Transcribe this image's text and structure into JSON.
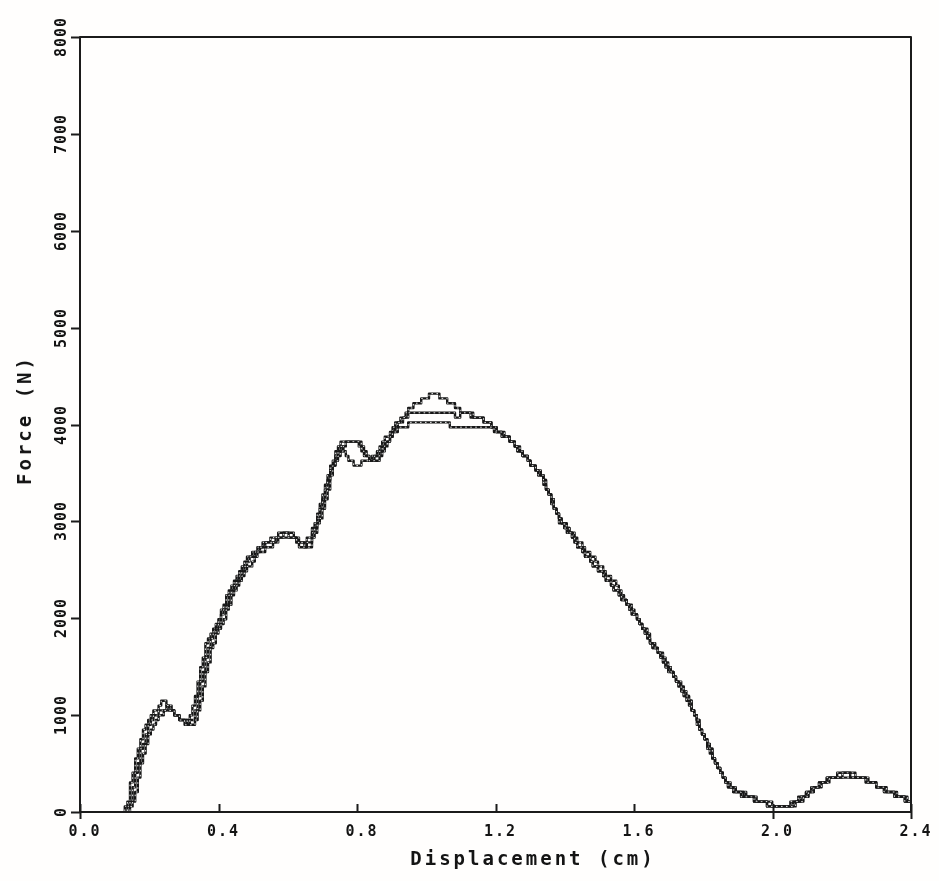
{
  "chart_data": {
    "type": "line",
    "title": "",
    "xlabel": "Displacement (cm)",
    "ylabel": "Force (N)",
    "xlim": [
      0,
      2.4
    ],
    "ylim": [
      0,
      8000
    ],
    "x_tick_labels": [
      "0.0",
      "0.4",
      "0.8",
      "1.2",
      "1.6",
      "2.0",
      "2.4"
    ],
    "x_tick_values": [
      0,
      0.4,
      0.8,
      1.2,
      1.6,
      2.0,
      2.4
    ],
    "y_tick_labels": [
      "0",
      "1000",
      "2000",
      "3000",
      "4000",
      "5000",
      "6000",
      "7000",
      "8000"
    ],
    "y_tick_values": [
      0,
      1000,
      2000,
      3000,
      4000,
      5000,
      6000,
      7000,
      8000
    ],
    "grid": "off",
    "legend": "none",
    "frame": "full-box",
    "line_color": "#171717",
    "plot_style": "digitized-plotter-steps",
    "series": [
      {
        "name": "trace-1",
        "points": [
          [
            0.128,
            0
          ],
          [
            0.14,
            130
          ],
          [
            0.152,
            360
          ],
          [
            0.166,
            600
          ],
          [
            0.182,
            820
          ],
          [
            0.198,
            950
          ],
          [
            0.214,
            1030
          ],
          [
            0.228,
            1090
          ],
          [
            0.238,
            1160
          ],
          [
            0.246,
            1115
          ],
          [
            0.262,
            1065
          ],
          [
            0.278,
            1000
          ],
          [
            0.292,
            950
          ],
          [
            0.306,
            928
          ],
          [
            0.32,
            975
          ],
          [
            0.335,
            1180
          ],
          [
            0.35,
            1480
          ],
          [
            0.365,
            1720
          ],
          [
            0.382,
            1870
          ],
          [
            0.4,
            1995
          ],
          [
            0.42,
            2180
          ],
          [
            0.44,
            2345
          ],
          [
            0.46,
            2475
          ],
          [
            0.48,
            2595
          ],
          [
            0.5,
            2690
          ],
          [
            0.522,
            2755
          ],
          [
            0.546,
            2805
          ],
          [
            0.57,
            2865
          ],
          [
            0.59,
            2905
          ],
          [
            0.61,
            2880
          ],
          [
            0.626,
            2810
          ],
          [
            0.646,
            2790
          ],
          [
            0.662,
            2815
          ],
          [
            0.676,
            2945
          ],
          [
            0.69,
            3105
          ],
          [
            0.705,
            3300
          ],
          [
            0.72,
            3520
          ],
          [
            0.736,
            3675
          ],
          [
            0.752,
            3790
          ],
          [
            0.766,
            3832
          ],
          [
            0.8,
            3835
          ],
          [
            0.814,
            3755
          ],
          [
            0.83,
            3655
          ],
          [
            0.846,
            3615
          ],
          [
            0.862,
            3660
          ],
          [
            0.878,
            3762
          ],
          [
            0.895,
            3872
          ],
          [
            0.912,
            3968
          ],
          [
            0.936,
            4092
          ],
          [
            0.962,
            4195
          ],
          [
            0.986,
            4262
          ],
          [
            1.008,
            4302
          ],
          [
            1.036,
            4296
          ],
          [
            1.058,
            4242
          ],
          [
            1.082,
            4186
          ],
          [
            1.106,
            4132
          ],
          [
            1.13,
            4086
          ],
          [
            1.156,
            4058
          ],
          [
            1.176,
            4018
          ],
          [
            1.196,
            3968
          ],
          [
            1.216,
            3905
          ],
          [
            1.242,
            3838
          ],
          [
            1.272,
            3718
          ],
          [
            1.302,
            3598
          ],
          [
            1.332,
            3475
          ],
          [
            1.356,
            3268
          ],
          [
            1.384,
            3012
          ],
          [
            1.415,
            2862
          ],
          [
            1.442,
            2742
          ],
          [
            1.47,
            2602
          ],
          [
            1.5,
            2478
          ],
          [
            1.53,
            2360
          ],
          [
            1.556,
            2248
          ],
          [
            1.586,
            2108
          ],
          [
            1.612,
            1985
          ],
          [
            1.644,
            1772
          ],
          [
            1.672,
            1628
          ],
          [
            1.702,
            1462
          ],
          [
            1.732,
            1295
          ],
          [
            1.76,
            1138
          ],
          [
            1.788,
            868
          ],
          [
            1.817,
            642
          ],
          [
            1.846,
            418
          ],
          [
            1.874,
            262
          ],
          [
            1.902,
            198
          ],
          [
            1.932,
            152
          ],
          [
            1.962,
            103
          ],
          [
            2.0,
            64
          ],
          [
            2.032,
            54
          ],
          [
            2.062,
            92
          ],
          [
            2.092,
            172
          ],
          [
            2.122,
            252
          ],
          [
            2.152,
            322
          ],
          [
            2.182,
            372
          ],
          [
            2.212,
            386
          ],
          [
            2.242,
            368
          ],
          [
            2.272,
            322
          ],
          [
            2.302,
            262
          ],
          [
            2.332,
            212
          ],
          [
            2.362,
            162
          ],
          [
            2.386,
            124
          ],
          [
            2.4,
            108
          ]
        ]
      },
      {
        "name": "trace-2",
        "points": [
          [
            0.136,
            0
          ],
          [
            0.148,
            120
          ],
          [
            0.16,
            340
          ],
          [
            0.174,
            580
          ],
          [
            0.19,
            800
          ],
          [
            0.206,
            935
          ],
          [
            0.222,
            1010
          ],
          [
            0.238,
            1065
          ],
          [
            0.252,
            1082
          ],
          [
            0.268,
            1040
          ],
          [
            0.284,
            975
          ],
          [
            0.298,
            932
          ],
          [
            0.312,
            912
          ],
          [
            0.326,
            952
          ],
          [
            0.342,
            1160
          ],
          [
            0.356,
            1450
          ],
          [
            0.372,
            1700
          ],
          [
            0.388,
            1855
          ],
          [
            0.406,
            1985
          ],
          [
            0.426,
            2170
          ],
          [
            0.446,
            2340
          ],
          [
            0.466,
            2468
          ],
          [
            0.486,
            2585
          ],
          [
            0.506,
            2682
          ],
          [
            0.528,
            2742
          ],
          [
            0.552,
            2792
          ],
          [
            0.576,
            2845
          ],
          [
            0.596,
            2872
          ],
          [
            0.614,
            2838
          ],
          [
            0.63,
            2772
          ],
          [
            0.65,
            2752
          ],
          [
            0.666,
            2792
          ],
          [
            0.68,
            2932
          ],
          [
            0.694,
            3092
          ],
          [
            0.709,
            3290
          ],
          [
            0.724,
            3512
          ],
          [
            0.74,
            3668
          ],
          [
            0.755,
            3788
          ],
          [
            0.77,
            3655
          ],
          [
            0.79,
            3592
          ],
          [
            0.812,
            3595
          ],
          [
            0.828,
            3622
          ],
          [
            0.845,
            3655
          ],
          [
            0.862,
            3738
          ],
          [
            0.88,
            3845
          ],
          [
            0.898,
            3942
          ],
          [
            0.918,
            4032
          ],
          [
            0.945,
            4098
          ],
          [
            0.975,
            4112
          ],
          [
            1.01,
            4112
          ],
          [
            1.045,
            4105
          ],
          [
            1.075,
            4112
          ],
          [
            1.088,
            4082
          ],
          [
            1.1,
            4108
          ],
          [
            1.13,
            4098
          ],
          [
            1.158,
            4062
          ],
          [
            1.18,
            4012
          ],
          [
            1.2,
            3952
          ],
          [
            1.218,
            3898
          ],
          [
            1.244,
            3832
          ],
          [
            1.274,
            3712
          ],
          [
            1.304,
            3592
          ],
          [
            1.334,
            3468
          ],
          [
            1.358,
            3262
          ],
          [
            1.386,
            3022
          ],
          [
            1.418,
            2878
          ],
          [
            1.444,
            2772
          ],
          [
            1.472,
            2658
          ],
          [
            1.502,
            2545
          ],
          [
            1.532,
            2415
          ],
          [
            1.558,
            2285
          ],
          [
            1.588,
            2122
          ],
          [
            1.614,
            1992
          ],
          [
            1.646,
            1782
          ],
          [
            1.674,
            1638
          ],
          [
            1.704,
            1472
          ],
          [
            1.734,
            1305
          ],
          [
            1.762,
            1148
          ],
          [
            1.79,
            878
          ],
          [
            1.819,
            652
          ],
          [
            1.848,
            428
          ],
          [
            1.876,
            272
          ],
          [
            1.904,
            208
          ],
          [
            1.934,
            162
          ],
          [
            1.964,
            113
          ],
          [
            2.002,
            74
          ],
          [
            2.034,
            62
          ],
          [
            2.064,
            100
          ],
          [
            2.094,
            180
          ],
          [
            2.124,
            260
          ],
          [
            2.154,
            330
          ],
          [
            2.184,
            380
          ],
          [
            2.214,
            394
          ],
          [
            2.244,
            376
          ],
          [
            2.274,
            330
          ],
          [
            2.304,
            270
          ],
          [
            2.334,
            220
          ],
          [
            2.364,
            170
          ],
          [
            2.388,
            132
          ],
          [
            2.4,
            116
          ]
        ]
      },
      {
        "name": "trace-3",
        "points": [
          [
            0.144,
            0
          ],
          [
            0.156,
            110
          ],
          [
            0.168,
            320
          ],
          [
            0.182,
            560
          ],
          [
            0.198,
            780
          ],
          [
            0.214,
            915
          ],
          [
            0.23,
            988
          ],
          [
            0.246,
            1045
          ],
          [
            0.26,
            1052
          ],
          [
            0.276,
            1012
          ],
          [
            0.292,
            952
          ],
          [
            0.306,
            912
          ],
          [
            0.32,
            898
          ],
          [
            0.334,
            935
          ],
          [
            0.35,
            1140
          ],
          [
            0.364,
            1430
          ],
          [
            0.38,
            1680
          ],
          [
            0.396,
            1840
          ],
          [
            0.414,
            1975
          ],
          [
            0.434,
            2160
          ],
          [
            0.454,
            2330
          ],
          [
            0.474,
            2458
          ],
          [
            0.494,
            2572
          ],
          [
            0.514,
            2668
          ],
          [
            0.536,
            2728
          ],
          [
            0.56,
            2778
          ],
          [
            0.584,
            2832
          ],
          [
            0.602,
            2855
          ],
          [
            0.62,
            2815
          ],
          [
            0.636,
            2745
          ],
          [
            0.656,
            2732
          ],
          [
            0.67,
            2772
          ],
          [
            0.684,
            2918
          ],
          [
            0.698,
            3078
          ],
          [
            0.713,
            3278
          ],
          [
            0.728,
            3500
          ],
          [
            0.744,
            3658
          ],
          [
            0.76,
            3782
          ],
          [
            0.775,
            3822
          ],
          [
            0.805,
            3818
          ],
          [
            0.82,
            3712
          ],
          [
            0.838,
            3638
          ],
          [
            0.858,
            3672
          ],
          [
            0.878,
            3785
          ],
          [
            0.898,
            3892
          ],
          [
            0.922,
            3972
          ],
          [
            0.95,
            4002
          ],
          [
            0.99,
            4012
          ],
          [
            1.03,
            4002
          ],
          [
            1.07,
            3995
          ],
          [
            1.11,
            3992
          ],
          [
            1.15,
            3988
          ],
          [
            1.18,
            3962
          ],
          [
            1.202,
            3932
          ],
          [
            1.22,
            3888
          ],
          [
            1.246,
            3825
          ],
          [
            1.276,
            3705
          ],
          [
            1.306,
            3585
          ],
          [
            1.336,
            3458
          ],
          [
            1.36,
            3252
          ],
          [
            1.388,
            2998
          ],
          [
            1.42,
            2848
          ],
          [
            1.446,
            2728
          ],
          [
            1.474,
            2588
          ],
          [
            1.504,
            2462
          ],
          [
            1.534,
            2342
          ],
          [
            1.56,
            2228
          ],
          [
            1.59,
            2092
          ],
          [
            1.616,
            1972
          ],
          [
            1.648,
            1758
          ],
          [
            1.676,
            1615
          ],
          [
            1.706,
            1448
          ],
          [
            1.736,
            1282
          ],
          [
            1.764,
            1125
          ],
          [
            1.792,
            855
          ],
          [
            1.821,
            630
          ],
          [
            1.85,
            405
          ],
          [
            1.878,
            250
          ],
          [
            1.906,
            188
          ],
          [
            1.936,
            142
          ],
          [
            1.966,
            95
          ],
          [
            2.004,
            56
          ],
          [
            2.036,
            48
          ],
          [
            2.066,
            84
          ],
          [
            2.096,
            164
          ],
          [
            2.126,
            244
          ],
          [
            2.156,
            314
          ],
          [
            2.186,
            364
          ],
          [
            2.216,
            376
          ],
          [
            2.246,
            358
          ],
          [
            2.276,
            314
          ],
          [
            2.306,
            255
          ],
          [
            2.336,
            205
          ],
          [
            2.366,
            155
          ],
          [
            2.39,
            118
          ],
          [
            2.4,
            102
          ]
        ]
      }
    ],
    "layout": {
      "plot_left": 80,
      "plot_top": 37,
      "plot_right": 911,
      "plot_bottom": 812,
      "x_down_stub_ticks": [
        0,
        2.0,
        2.4
      ]
    }
  }
}
